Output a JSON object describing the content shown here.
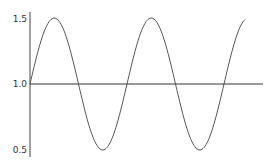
{
  "chart_data": {
    "type": "line",
    "title": "",
    "xlabel": "",
    "ylabel": "",
    "ylim": [
      0.5,
      1.5
    ],
    "yticks": [
      "1.5",
      "1.0",
      "0.5"
    ],
    "grid": false,
    "legend": null,
    "series": [
      {
        "name": "sine",
        "function": "1 + 0.5*sin(x)",
        "x_range": [
          0,
          14.4
        ],
        "color": "#555555"
      },
      {
        "name": "baseline",
        "function": "1.0",
        "color": "#333333"
      }
    ]
  },
  "axis": {
    "tick_1_5": "1.5",
    "tick_1_0": "1.0",
    "tick_0_5": "0.5"
  }
}
